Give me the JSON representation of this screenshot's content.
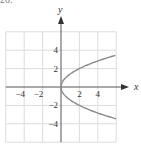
{
  "corner_label": "20.",
  "chart_data": {
    "type": "line",
    "title": "",
    "xlabel": "x",
    "ylabel": "y",
    "xlim": [
      -6,
      6
    ],
    "ylim": [
      -6,
      6
    ],
    "grid": true,
    "grid_step": 2,
    "x_ticks": [
      -4,
      -2,
      2,
      4
    ],
    "y_ticks": [
      4,
      2,
      -2,
      -4
    ],
    "x_tick_labels": [
      "−4",
      "−2",
      "2",
      "4"
    ],
    "y_tick_labels": [
      "4",
      "2",
      "−2",
      "−4"
    ],
    "series": [
      {
        "name": "x = y^2/2",
        "color": "#8a8a8a",
        "points": [
          [
            6,
            3.46
          ],
          [
            4.5,
            3
          ],
          [
            2,
            2
          ],
          [
            0.5,
            1
          ],
          [
            0,
            0
          ],
          [
            0.5,
            -1
          ],
          [
            2,
            -2
          ],
          [
            4.5,
            -3
          ],
          [
            6,
            -3.46
          ]
        ]
      }
    ],
    "colors": {
      "grid": "#dcdcdc",
      "axis": "#555555",
      "curve": "#8a8a8a"
    }
  }
}
